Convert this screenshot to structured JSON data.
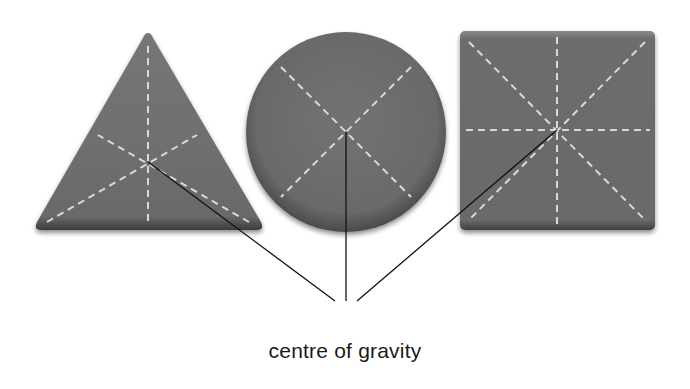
{
  "diagram": {
    "label": "centre of gravity",
    "colors": {
      "shape_fill": "#6b6b6b",
      "shape_edge": "#3a3a3a",
      "dash_line": "#d9d9d9",
      "pointer_line": "#111111",
      "background": "#ffffff"
    },
    "shapes": [
      {
        "type": "triangle",
        "name": "equilateral-triangle",
        "centre": [
          147,
          162
        ]
      },
      {
        "type": "circle",
        "name": "circle",
        "centre": [
          346,
          132
        ]
      },
      {
        "type": "square",
        "name": "square",
        "centre": [
          557,
          130
        ]
      }
    ]
  }
}
